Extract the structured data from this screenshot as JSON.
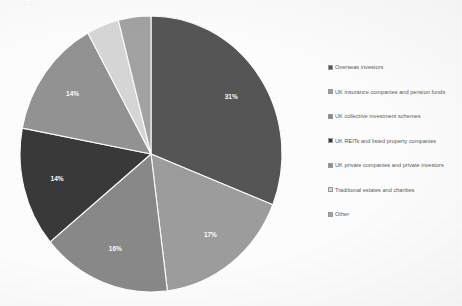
{
  "title_fragment": "· · ·  ·  ·",
  "chart_data": {
    "type": "pie",
    "title": "",
    "labels": [
      "Overseas investors",
      "UK insurance companies and pension funds",
      "UK collective investment schemes",
      "UK REITs and listed property companies",
      "UK private companies and private investors",
      "Traditional estates and charities",
      "Other"
    ],
    "values": [
      31,
      17,
      16,
      14,
      14,
      4,
      4
    ],
    "value_labels": [
      "31%",
      "17%",
      "16%",
      "14%",
      "14%",
      "4%",
      "4%"
    ],
    "colors": [
      "#565656",
      "#9e9e9e",
      "#8a8a8a",
      "#3a3a3a",
      "#949494",
      "#d8d8d8",
      "#a4a4a4"
    ],
    "start_angle_deg": 0,
    "direction": "clockwise",
    "legend_position": "right",
    "grid": false,
    "units": "percent"
  },
  "legend": {
    "items": [
      {
        "label": "Overseas investors",
        "color": "#565656"
      },
      {
        "label": "UK insurance companies and pension funds",
        "color": "#9e9e9e"
      },
      {
        "label": "UK collective investment schemes",
        "color": "#8a8a8a"
      },
      {
        "label": "UK REITs and listed property companies",
        "color": "#3a3a3a"
      },
      {
        "label": "UK private companies and private investors",
        "color": "#949494"
      },
      {
        "label": "Traditional estates and charities",
        "color": "#d8d8d8"
      },
      {
        "label": "Other",
        "color": "#a4a4a4"
      }
    ]
  }
}
